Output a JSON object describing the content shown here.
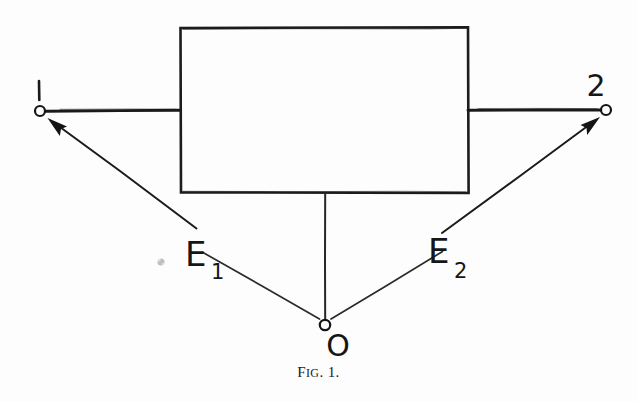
{
  "figure": {
    "caption_prefix": "F",
    "caption_smallcaps": "IG",
    "caption_suffix": ". 1.",
    "caption_full": "Fig. 1.",
    "background_color": "#fdfdfd",
    "ink_color": "#1a1a1a"
  },
  "diagram": {
    "type": "two-port-network-schematic",
    "black_box": {
      "label": "",
      "x": 180,
      "y": 27,
      "width": 288,
      "height": 166
    },
    "terminals": [
      {
        "id": "terminal-1",
        "label": "1",
        "cx": 40,
        "cy": 111,
        "r": 5
      },
      {
        "id": "terminal-2",
        "label": "2",
        "cx": 606,
        "cy": 110,
        "r": 5
      },
      {
        "id": "terminal-o",
        "label": "O",
        "cx": 325,
        "cy": 325,
        "r": 5
      }
    ],
    "sources": [
      {
        "id": "source-e1",
        "label": "E",
        "subscript": "1",
        "x": 185,
        "y": 255
      },
      {
        "id": "source-e2",
        "label": "E",
        "subscript": "2",
        "x": 428,
        "y": 252
      }
    ],
    "leads": [
      {
        "id": "lead-left",
        "from": [
          45,
          111
        ],
        "to": [
          180,
          110
        ]
      },
      {
        "id": "lead-right",
        "from": [
          468,
          110
        ],
        "to": [
          601,
          110
        ]
      },
      {
        "id": "lead-bottom",
        "from": [
          325,
          193
        ],
        "to": [
          325,
          320
        ]
      }
    ],
    "arrows": [
      {
        "id": "arrow-e1",
        "from": [
          196,
          228
        ],
        "to": [
          49,
          119
        ],
        "points_to": "terminal-1"
      },
      {
        "id": "arrow-e2",
        "from": [
          442,
          233
        ],
        "to": [
          598,
          118
        ],
        "points_to": "terminal-2"
      }
    ],
    "connector_lines": [
      {
        "id": "connector-e1-o",
        "from": [
          203,
          253
        ],
        "to": [
          319,
          319
        ]
      },
      {
        "id": "connector-o-e2",
        "from": [
          331,
          319
        ],
        "to": [
          442,
          252
        ]
      }
    ],
    "artifacts": [
      {
        "id": "ink-smudge",
        "cx": 161,
        "cy": 262,
        "r": 4
      }
    ]
  }
}
